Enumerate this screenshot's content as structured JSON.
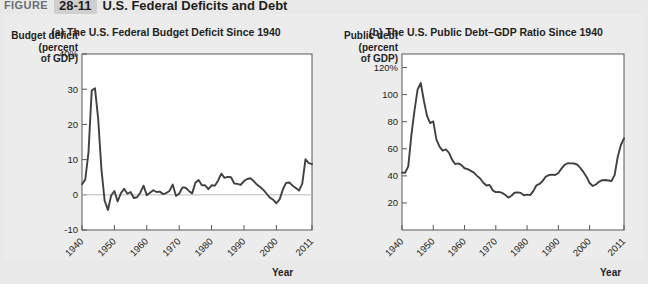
{
  "figure": {
    "label": "Figure",
    "number": "28-11",
    "title": "U.S. Federal Deficits and Debt"
  },
  "panels": [
    {
      "id": "a",
      "title": "(a) The U.S. Federal Budget Deficit Since 1940",
      "y_axis_title": "Budget deficit\n(percent\nof GDP)",
      "x_axis_title": "Year"
    },
    {
      "id": "b",
      "title": "(b) The U.S. Public Debt–GDP Ratio Since 1940",
      "y_axis_title": "Public debt\n(percent\nof GDP)",
      "x_axis_title": "Year"
    }
  ],
  "chart_data": [
    {
      "type": "line",
      "title": "(a) The U.S. Federal Budget Deficit Since 1940",
      "xlabel": "Year",
      "ylabel": "Budget deficit (percent of GDP)",
      "xlim": [
        1940,
        2011
      ],
      "ylim": [
        -10,
        40
      ],
      "ytick_labels": [
        "40%",
        "30",
        "20",
        "10",
        "0",
        "-10"
      ],
      "ytick_values": [
        40,
        30,
        20,
        10,
        0,
        -10
      ],
      "xtick_labels": [
        "1940",
        "1950",
        "1960",
        "1970",
        "1980",
        "1990",
        "2000",
        "2011"
      ],
      "xtick_values": [
        1940,
        1950,
        1960,
        1970,
        1980,
        1990,
        2000,
        2011
      ],
      "grid": false,
      "legend": "none",
      "zero_reference_line": 0,
      "x": [
        1940,
        1941,
        1942,
        1943,
        1944,
        1945,
        1946,
        1947,
        1948,
        1949,
        1950,
        1951,
        1952,
        1953,
        1954,
        1955,
        1956,
        1957,
        1958,
        1959,
        1960,
        1961,
        1962,
        1963,
        1964,
        1965,
        1966,
        1967,
        1968,
        1969,
        1970,
        1971,
        1972,
        1973,
        1974,
        1975,
        1976,
        1977,
        1978,
        1979,
        1980,
        1981,
        1982,
        1983,
        1984,
        1985,
        1986,
        1987,
        1988,
        1989,
        1990,
        1991,
        1992,
        1993,
        1994,
        1995,
        1996,
        1997,
        1998,
        1999,
        2000,
        2001,
        2002,
        2003,
        2004,
        2005,
        2006,
        2007,
        2008,
        2009,
        2010,
        2011
      ],
      "values": [
        3.0,
        4.3,
        12.0,
        29.6,
        30.3,
        21.5,
        7.2,
        -1.7,
        -4.3,
        -0.2,
        1.1,
        -1.9,
        0.4,
        1.7,
        0.3,
        0.8,
        -0.9,
        -0.7,
        0.6,
        2.6,
        -0.1,
        0.6,
        1.3,
        0.8,
        0.9,
        0.2,
        0.5,
        1.1,
        2.9,
        -0.3,
        0.3,
        2.1,
        2.0,
        1.1,
        0.4,
        3.4,
        4.2,
        2.7,
        2.7,
        1.6,
        2.7,
        2.6,
        4.0,
        6.0,
        4.8,
        5.1,
        5.0,
        3.2,
        3.1,
        2.8,
        3.9,
        4.5,
        4.7,
        3.9,
        2.9,
        2.2,
        1.4,
        0.3,
        -0.8,
        -1.4,
        -2.4,
        -1.3,
        1.5,
        3.4,
        3.5,
        2.6,
        1.9,
        1.2,
        3.2,
        10.1,
        9.0,
        8.7
      ],
      "annotations": [
        {
          "text": "WWII deficit peak near 30% of GDP (1943–1944)"
        },
        {
          "text": "Post-2008 recession deficits near 10% of GDP"
        }
      ]
    },
    {
      "type": "line",
      "title": "(b) The U.S. Public Debt–GDP Ratio Since 1940",
      "xlabel": "Year",
      "ylabel": "Public debt (percent of GDP)",
      "xlim": [
        1940,
        2011
      ],
      "ylim": [
        0,
        130
      ],
      "ytick_labels": [
        "120%",
        "100",
        "80",
        "60",
        "40",
        "20"
      ],
      "ytick_values": [
        120,
        100,
        80,
        60,
        40,
        20
      ],
      "xtick_labels": [
        "1940",
        "1950",
        "1960",
        "1970",
        "1980",
        "1990",
        "2000",
        "2011"
      ],
      "xtick_values": [
        1940,
        1950,
        1960,
        1970,
        1980,
        1990,
        2000,
        2011
      ],
      "grid": false,
      "legend": "none",
      "x": [
        1940,
        1941,
        1942,
        1943,
        1944,
        1945,
        1946,
        1947,
        1948,
        1949,
        1950,
        1951,
        1952,
        1953,
        1954,
        1955,
        1956,
        1957,
        1958,
        1959,
        1960,
        1961,
        1962,
        1963,
        1964,
        1965,
        1966,
        1967,
        1968,
        1969,
        1970,
        1971,
        1972,
        1973,
        1974,
        1975,
        1976,
        1977,
        1978,
        1979,
        1980,
        1981,
        1982,
        1983,
        1984,
        1985,
        1986,
        1987,
        1988,
        1989,
        1990,
        1991,
        1992,
        1993,
        1994,
        1995,
        1996,
        1997,
        1998,
        1999,
        2000,
        2001,
        2002,
        2003,
        2004,
        2005,
        2006,
        2007,
        2008,
        2009,
        2010,
        2011
      ],
      "values": [
        42.4,
        42.3,
        47.0,
        70.0,
        88.3,
        103.9,
        108.6,
        95.5,
        84.3,
        79.0,
        80.2,
        66.9,
        61.6,
        58.6,
        59.5,
        57.2,
        52.0,
        48.7,
        49.2,
        47.9,
        45.6,
        45.0,
        43.7,
        42.4,
        40.0,
        38.0,
        34.9,
        32.9,
        33.3,
        29.3,
        28.0,
        28.1,
        27.4,
        26.0,
        23.9,
        25.3,
        27.5,
        27.8,
        27.4,
        25.6,
        26.1,
        25.8,
        28.7,
        33.0,
        34.0,
        36.3,
        39.5,
        40.6,
        40.9,
        40.6,
        42.1,
        45.3,
        48.1,
        49.3,
        49.2,
        49.1,
        48.4,
        45.9,
        42.9,
        39.4,
        34.7,
        32.5,
        33.6,
        35.6,
        36.8,
        36.9,
        36.6,
        36.2,
        40.5,
        54.1,
        62.8,
        67.7
      ],
      "annotations": [
        {
          "text": "Debt–GDP ratio peaks above 100% just after WWII"
        },
        {
          "text": "Ratio rises sharply after 2008 to roughly 68%"
        }
      ]
    }
  ]
}
